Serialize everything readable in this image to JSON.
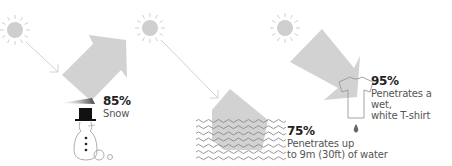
{
  "colors": {
    "sun": "#cfcfcf",
    "beam": "#d2d2d2",
    "outline": "#9a9a9a",
    "text_strong": "#222222",
    "text_muted": "#555555"
  },
  "panels": [
    {
      "id": "snow",
      "percent": "85%",
      "description_lines": [
        "Snow"
      ],
      "icons": [
        "sun-icon",
        "arrow-beam",
        "snowman-icon"
      ]
    },
    {
      "id": "water",
      "percent": "75%",
      "description_lines": [
        "Penetrates up",
        "to 9m (30ft) of water"
      ],
      "icons": [
        "sun-icon",
        "arrow-beam",
        "waves-icon"
      ]
    },
    {
      "id": "shirt",
      "percent": "95%",
      "description_lines": [
        "Penetrates a wet,",
        "white T-shirt"
      ],
      "icons": [
        "sun-icon",
        "arrow-beam",
        "t-shirt-icon",
        "water-drop-icon"
      ]
    }
  ]
}
